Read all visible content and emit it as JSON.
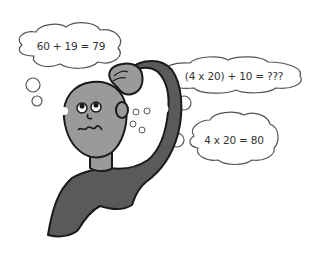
{
  "illustration": {
    "subject": "confused person scratching head",
    "colors": {
      "skin": "#9a9a9a",
      "shirt": "#5a5a5a",
      "outline": "#1a1a1a",
      "bubble_stroke": "#555555"
    },
    "thought_bubbles": [
      {
        "id": "bubble-1",
        "text": "60 + 19 = 79"
      },
      {
        "id": "bubble-2",
        "text": "(4 x 20) + 10 = ???"
      },
      {
        "id": "bubble-3",
        "text": "4 x 20 = 80"
      }
    ]
  }
}
